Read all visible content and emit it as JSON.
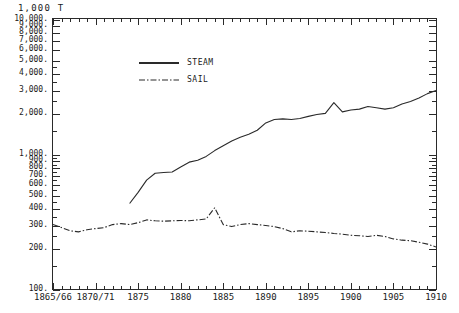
{
  "unit_label": "1,000 T",
  "legend": {
    "position": "top-left-inside",
    "entries": [
      {
        "label": "STEAM",
        "style": "solid",
        "color": "#2a2a2a"
      },
      {
        "label": "SAIL",
        "style": "dashdot",
        "color": "#2a2a2a"
      }
    ]
  },
  "axes": {
    "y": {
      "scale": "log",
      "min": 100,
      "max": 10000,
      "ticks": [
        {
          "value": 10000,
          "label": "10,000."
        },
        {
          "value": 9000,
          "label": "9,000."
        },
        {
          "value": 8000,
          "label": "8,000."
        },
        {
          "value": 7000,
          "label": "7,000."
        },
        {
          "value": 6000,
          "label": "6,000."
        },
        {
          "value": 5000,
          "label": "5,000."
        },
        {
          "value": 4000,
          "label": "4,000."
        },
        {
          "value": 3000,
          "label": "3,000."
        },
        {
          "value": 2000,
          "label": "2,000."
        },
        {
          "value": 1000,
          "label": "1,000."
        },
        {
          "value": 900,
          "label": "900."
        },
        {
          "value": 800,
          "label": "800."
        },
        {
          "value": 700,
          "label": "700."
        },
        {
          "value": 600,
          "label": "600."
        },
        {
          "value": 500,
          "label": "500."
        },
        {
          "value": 400,
          "label": "400."
        },
        {
          "value": 300,
          "label": "300."
        },
        {
          "value": 200,
          "label": "200."
        },
        {
          "value": 100,
          "label": "100."
        }
      ]
    },
    "x": {
      "min": 1865,
      "max": 1910,
      "ticks": [
        {
          "value": 1865,
          "label": "1865/66"
        },
        {
          "value": 1870,
          "label": "1870/71"
        },
        {
          "value": 1875,
          "label": "1875"
        },
        {
          "value": 1880,
          "label": "1880"
        },
        {
          "value": 1885,
          "label": "1885"
        },
        {
          "value": 1890,
          "label": "1890"
        },
        {
          "value": 1895,
          "label": "1895"
        },
        {
          "value": 1900,
          "label": "1900"
        },
        {
          "value": 1905,
          "label": "1905"
        },
        {
          "value": 1910,
          "label": "1910"
        }
      ],
      "minor_step": 1
    }
  },
  "chart_data": {
    "type": "line",
    "title": "",
    "subtitle": "",
    "xlabel": "",
    "ylabel": "1,000 T",
    "yscale": "log",
    "ylim": [
      100,
      10000
    ],
    "xlim": [
      1865,
      1910
    ],
    "grid": false,
    "legend_position": "top-left-inside",
    "series": [
      {
        "name": "STEAM",
        "style": "solid",
        "color": "#2a2a2a",
        "x": [
          1874,
          1875,
          1876,
          1877,
          1878,
          1879,
          1880,
          1881,
          1882,
          1883,
          1884,
          1885,
          1886,
          1887,
          1888,
          1889,
          1890,
          1891,
          1892,
          1893,
          1894,
          1895,
          1896,
          1897,
          1898,
          1899,
          1900,
          1901,
          1902,
          1903,
          1904,
          1905,
          1906,
          1907,
          1908,
          1909,
          1910
        ],
        "y": [
          430,
          520,
          640,
          720,
          730,
          735,
          800,
          870,
          900,
          960,
          1060,
          1150,
          1250,
          1330,
          1400,
          1500,
          1700,
          1800,
          1820,
          1800,
          1830,
          1900,
          1960,
          2000,
          2400,
          2050,
          2120,
          2150,
          2250,
          2200,
          2150,
          2200,
          2350,
          2450,
          2600,
          2800,
          2950
        ]
      },
      {
        "name": "SAIL",
        "style": "dashdot",
        "color": "#2a2a2a",
        "x": [
          1865,
          1866,
          1867,
          1868,
          1869,
          1870,
          1871,
          1872,
          1873,
          1874,
          1875,
          1876,
          1877,
          1878,
          1879,
          1880,
          1881,
          1882,
          1883,
          1884,
          1885,
          1886,
          1887,
          1888,
          1889,
          1890,
          1891,
          1892,
          1893,
          1894,
          1895,
          1896,
          1897,
          1898,
          1899,
          1900,
          1901,
          1902,
          1903,
          1904,
          1905,
          1906,
          1907,
          1908,
          1909,
          1910
        ],
        "y": [
          300,
          285,
          270,
          265,
          275,
          280,
          285,
          300,
          305,
          300,
          310,
          325,
          320,
          318,
          320,
          322,
          320,
          325,
          330,
          400,
          300,
          290,
          300,
          305,
          300,
          295,
          290,
          280,
          265,
          270,
          268,
          265,
          262,
          258,
          255,
          250,
          248,
          245,
          250,
          245,
          235,
          230,
          228,
          222,
          215,
          205
        ]
      }
    ]
  }
}
